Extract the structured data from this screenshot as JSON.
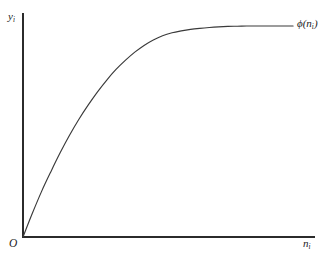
{
  "figure": {
    "background_color": "#ffffff",
    "line_color": "#2b2b2b",
    "curve_color": "#3a3a3a",
    "origin_label": "O",
    "y_axis_label_base": "y",
    "y_axis_label_sub": "i",
    "x_axis_label_base": "n",
    "x_axis_label_sub": "i",
    "curve_label_phi": "ϕ(",
    "curve_label_base": "n",
    "curve_label_sub": "i",
    "curve_label_close": ")"
  },
  "chart_data": {
    "type": "line",
    "title": "",
    "subtitle": "",
    "xlabel": "n_i",
    "ylabel": "y_i",
    "legend": [
      "ϕ(n_i)"
    ],
    "legend_position": "curve-end-right",
    "grid": false,
    "axis_arrows": false,
    "tick_labels_x": [],
    "tick_labels_y": [],
    "xlim": [
      0,
      1
    ],
    "ylim": [
      0,
      1
    ],
    "annotations": [
      {
        "text": "O",
        "role": "origin",
        "x": 0,
        "y": 0
      },
      {
        "text": "y_i",
        "role": "y-axis-label",
        "x": 0,
        "y": 1
      },
      {
        "text": "n_i",
        "role": "x-axis-label",
        "x": 1,
        "y": 0
      },
      {
        "text": "ϕ(n_i)",
        "role": "curve-label",
        "x": 0.94,
        "y": 0.945
      }
    ],
    "series": [
      {
        "name": "ϕ(n_i)",
        "description": "concave increasing production function through the origin",
        "x": [
          0.0,
          0.034,
          0.068,
          0.103,
          0.137,
          0.171,
          0.205,
          0.24,
          0.274,
          0.308,
          0.342,
          0.377,
          0.411,
          0.445,
          0.479,
          0.513,
          0.548,
          0.582,
          0.616,
          0.65,
          0.685,
          0.719,
          0.753,
          0.787,
          0.822,
          0.856,
          0.89,
          0.924,
          0.959,
          0.993
        ],
        "y": [
          0.0,
          0.111,
          0.215,
          0.311,
          0.4,
          0.482,
          0.557,
          0.626,
          0.688,
          0.744,
          0.794,
          0.838,
          0.876,
          0.908,
          0.934,
          0.954,
          0.968,
          0.977,
          0.984,
          0.989,
          0.993,
          0.996,
          0.998,
          0.999,
          1.0,
          1.0,
          1.0,
          1.0,
          1.0,
          1.0
        ]
      }
    ],
    "geometry_px": {
      "origin": [
        23,
        237
      ],
      "y_axis_top": [
        23,
        13
      ],
      "x_axis_right": [
        315,
        237
      ],
      "curve_end": [
        295,
        26
      ],
      "sampled_points": [
        [
          23,
          237
        ],
        [
          60,
          172
        ],
        [
          105,
          118
        ],
        [
          140,
          94
        ],
        [
          165,
          78
        ],
        [
          195,
          60
        ],
        [
          225,
          48
        ],
        [
          258,
          36
        ],
        [
          295,
          26
        ]
      ]
    }
  }
}
